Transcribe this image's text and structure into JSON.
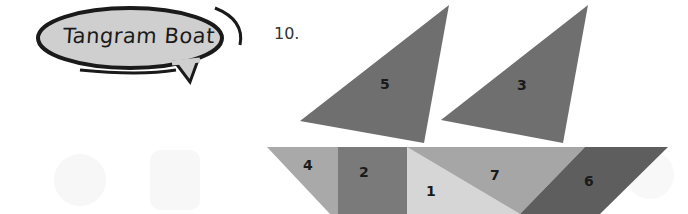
{
  "title": "Tangram Boat",
  "problem_number": "10.",
  "pieces": [
    {
      "id": "5",
      "label": "5",
      "shape": "large-triangle",
      "role": "sail-left",
      "color": "#6f6f6f"
    },
    {
      "id": "3",
      "label": "3",
      "shape": "large-triangle",
      "role": "sail-right",
      "color": "#6f6f6f"
    },
    {
      "id": "4",
      "label": "4",
      "shape": "small-triangle",
      "role": "hull",
      "color": "#a9a9a9"
    },
    {
      "id": "2",
      "label": "2",
      "shape": "square",
      "role": "hull",
      "color": "#7a7a7a"
    },
    {
      "id": "1",
      "label": "1",
      "shape": "triangle",
      "role": "hull",
      "color": "#d6d6d6"
    },
    {
      "id": "7",
      "label": "7",
      "shape": "triangle",
      "role": "hull",
      "color": "#a6a6a6"
    },
    {
      "id": "6",
      "label": "6",
      "shape": "parallelogram",
      "role": "hull",
      "color": "#5e5e5e"
    }
  ]
}
